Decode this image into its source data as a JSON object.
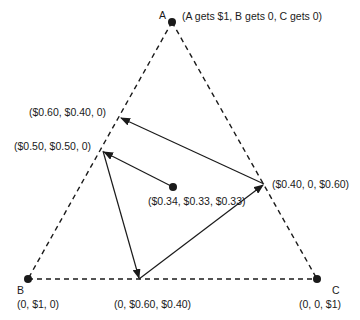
{
  "diagram": {
    "type": "simplex-triangle",
    "vertices": {
      "A": {
        "label": "A",
        "payoff": "(A gets $1, B gets 0, C gets 0)"
      },
      "B": {
        "label": "B",
        "payoff": "(0, $1, 0)"
      },
      "C": {
        "label": "C",
        "payoff": "(0, 0, $1)"
      }
    },
    "points": {
      "center": "($0.34, $0.33, $0.33)",
      "ab1": "($0.60, $0.40, 0)",
      "ab2": "($0.50, $0.50, 0)",
      "ac": "($0.40, 0, $0.60)",
      "bc": "(0, $0.60, $0.40)"
    },
    "arrows": [
      {
        "from": "($0.34, $0.33, $0.33)",
        "to": "($0.50, $0.50, 0)"
      },
      {
        "from": "($0.50, $0.50, 0)",
        "to": "(0, $0.60, $0.40)"
      },
      {
        "from": "(0, $0.60, $0.40)",
        "to": "($0.40, 0, $0.60)"
      },
      {
        "from": "($0.40, 0, $0.60)",
        "to": "($0.60, $0.40, 0)"
      }
    ],
    "colors": {
      "line": "#1a1a1a",
      "background": "#ffffff"
    }
  }
}
